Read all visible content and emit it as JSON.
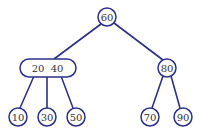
{
  "diagram": {
    "type": "2-3 tree",
    "root": {
      "keys": [
        "60"
      ]
    },
    "level1": [
      {
        "id": "n2040",
        "keys": [
          "20",
          "40"
        ],
        "label": "20  40"
      },
      {
        "id": "n80",
        "keys": [
          "80"
        ],
        "label": "80"
      }
    ],
    "leaves": [
      {
        "id": "n10",
        "label": "10",
        "parent": "n2040"
      },
      {
        "id": "n30",
        "label": "30",
        "parent": "n2040"
      },
      {
        "id": "n50",
        "label": "50",
        "parent": "n2040"
      },
      {
        "id": "n70",
        "label": "70",
        "parent": "n80"
      },
      {
        "id": "n90",
        "label": "90",
        "parent": "n80"
      }
    ],
    "root_label": "60",
    "colors": {
      "stroke": "#2b2f8a",
      "text": "#333333",
      "fill": "#ffffff"
    }
  }
}
